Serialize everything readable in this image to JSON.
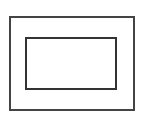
{
  "diagram": {
    "background": "#ffffff",
    "shapes": [
      {
        "name": "outer-rectangle",
        "x": 9,
        "y": 16,
        "width": 126,
        "height": 95,
        "stroke": "#444444",
        "stroke_width": 2
      },
      {
        "name": "inner-rectangle",
        "x": 25,
        "y": 37,
        "width": 92,
        "height": 53,
        "stroke": "#333333",
        "stroke_width": 2
      }
    ]
  }
}
